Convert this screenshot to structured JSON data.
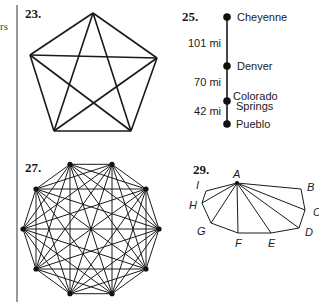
{
  "margin_fragment": "rs",
  "exercises": [
    {
      "number": "23.",
      "type": "complete-graph",
      "vertex_count": 5,
      "description": "Pentagon with all diagonals (K5)"
    },
    {
      "number": "25.",
      "type": "route-map",
      "stops": [
        "Cheyenne",
        "Denver",
        "Colorado",
        "Springs",
        "Pueblo"
      ],
      "cities": [
        "Cheyenne",
        "Denver",
        "Colorado Springs",
        "Pueblo"
      ],
      "distances": [
        "101 mi",
        "70 mi",
        "42 mi"
      ]
    },
    {
      "number": "27.",
      "type": "complete-graph",
      "vertex_count": 10,
      "description": "Decagon with all diagonals (K10)"
    },
    {
      "number": "29.",
      "type": "polygon-triangulation",
      "vertices": [
        "A",
        "B",
        "C",
        "D",
        "E",
        "F",
        "G",
        "H",
        "I"
      ],
      "hub": "A"
    }
  ]
}
